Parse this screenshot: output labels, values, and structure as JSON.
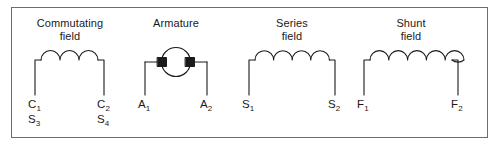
{
  "figure": {
    "border_color": "#6d6d6d",
    "line_color": "#1a1a1a",
    "background": "#ffffff"
  },
  "groups": [
    {
      "id": "commutating-field",
      "name": "Commutating field",
      "caption": "Commutating\nfield",
      "symbol": "coil",
      "loops": 3,
      "terminals": [
        {
          "id": "left",
          "primary": "C",
          "primary_sub": "1",
          "secondary": "S",
          "secondary_sub": "3"
        },
        {
          "id": "right",
          "primary": "C",
          "primary_sub": "2",
          "secondary": "S",
          "secondary_sub": "4"
        }
      ]
    },
    {
      "id": "armature",
      "name": "Armature",
      "caption": "Armature",
      "symbol": "armature-circle-with-brushes",
      "loops": 0,
      "terminals": [
        {
          "id": "left",
          "primary": "A",
          "primary_sub": "1",
          "secondary": "",
          "secondary_sub": ""
        },
        {
          "id": "right",
          "primary": "A",
          "primary_sub": "2",
          "secondary": "",
          "secondary_sub": ""
        }
      ]
    },
    {
      "id": "series-field",
      "name": "Series field",
      "caption": "Series\nfield",
      "symbol": "coil",
      "loops": 4,
      "terminals": [
        {
          "id": "left",
          "primary": "S",
          "primary_sub": "1",
          "secondary": "",
          "secondary_sub": ""
        },
        {
          "id": "right",
          "primary": "S",
          "primary_sub": "2",
          "secondary": "",
          "secondary_sub": ""
        }
      ]
    },
    {
      "id": "shunt-field",
      "name": "Shunt field",
      "caption": "Shunt\nfield",
      "symbol": "coil",
      "loops": 6,
      "terminals": [
        {
          "id": "left",
          "primary": "F",
          "primary_sub": "1",
          "secondary": "",
          "secondary_sub": ""
        },
        {
          "id": "right",
          "primary": "F",
          "primary_sub": "2",
          "secondary": "",
          "secondary_sub": ""
        }
      ]
    }
  ],
  "labels": {
    "commutating_caption": "Commutating\nfield",
    "armature_caption": "Armature",
    "series_caption": "Series\nfield",
    "shunt_caption": "Shunt\nfield",
    "c1": "C",
    "c1_sub": "1",
    "s3": "S",
    "s3_sub": "3",
    "c2": "C",
    "c2_sub": "2",
    "s4": "S",
    "s4_sub": "4",
    "a1": "A",
    "a1_sub": "1",
    "a2": "A",
    "a2_sub": "2",
    "s1": "S",
    "s1_sub": "1",
    "s2": "S",
    "s2_sub": "2",
    "f1": "F",
    "f1_sub": "1",
    "f2": "F",
    "f2_sub": "2"
  }
}
